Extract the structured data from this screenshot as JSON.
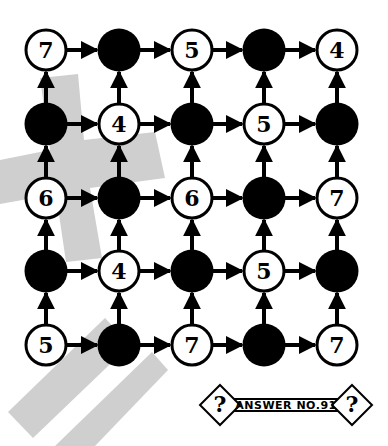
{
  "puzzle": {
    "grid": [
      [
        "7",
        "",
        "5",
        "",
        "4"
      ],
      [
        "",
        "4",
        "",
        "5",
        ""
      ],
      [
        "6",
        "",
        "6",
        "",
        "7"
      ],
      [
        "",
        "4",
        "",
        "5",
        ""
      ],
      [
        "5",
        "",
        "7",
        "",
        "7"
      ]
    ],
    "filled_cells_note": "empty strings are solid black circles",
    "arrows": {
      "horizontal": "right",
      "vertical": "up"
    }
  },
  "answer_banner": {
    "label": "ANSWER NO.91",
    "left_icon": "?",
    "right_icon": "?"
  },
  "colors": {
    "ink": "#000000",
    "background": "#ffffff",
    "watermark": "#cfcfcf"
  }
}
